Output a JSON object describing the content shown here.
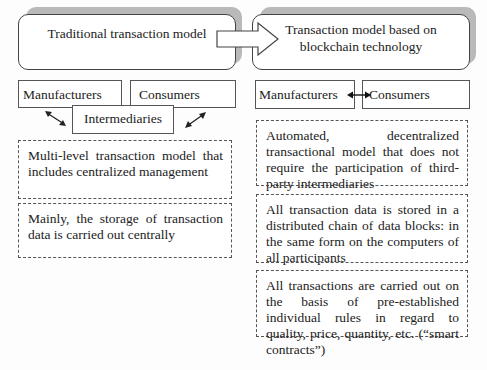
{
  "left": {
    "title": "Traditional transaction model",
    "manufacturers": "Manufacturers",
    "consumers": "Consumers",
    "intermediaries": "Intermediaries",
    "features": [
      "Multi-level transaction model that in­cludes centralized management",
      "Mainly, the storage of transaction data is carried out centrally"
    ]
  },
  "right": {
    "title": "Transaction model based on blockchain technology",
    "manufacturers": "Manufacturers",
    "consumers": "Consumers",
    "features": [
      "Automated, decentralized transactional model that does not require the partici­pation of third-party intermediaries",
      "All transaction data is stored in a dis­tributed chain of data blocks: in the same form on the computers of all par­ticipants",
      "All transactions are carried out on the basis of pre-established individual rules in regard to quality, price, quantity, etc. (“smart contracts”)"
    ]
  },
  "icons": {
    "transition_arrow": "block-arrow-right",
    "left_connectors": "double-headed-diagonal-arrows",
    "right_connector": "double-headed-horizontal-arrow"
  }
}
